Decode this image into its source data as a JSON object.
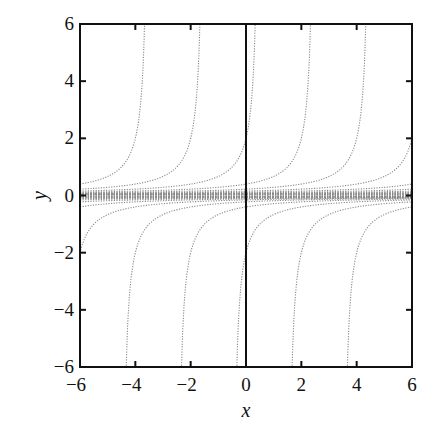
{
  "chart_data": {
    "type": "line",
    "title": "",
    "xlabel": "x",
    "ylabel": "y",
    "xlim": [
      -6,
      6
    ],
    "ylim": [
      -6,
      6
    ],
    "grid": false,
    "legend": null,
    "x_ticks": [
      -6,
      -4,
      -2,
      0,
      2,
      4,
      6
    ],
    "y_ticks": [
      -6,
      -4,
      -2,
      0,
      2,
      4,
      6
    ],
    "x_tick_labels": [
      "−6",
      "−4",
      "−2",
      "0",
      "2",
      "4",
      "6"
    ],
    "y_tick_labels": [
      "−6",
      "−4",
      "−2",
      "0",
      "2",
      "4",
      "6"
    ],
    "vertical_reference_line_x": 0,
    "curve_style": "dotted gray",
    "series": [
      {
        "name": "upper branch c=-3.5",
        "formula": "y=1/(c-x)",
        "c": -3.5,
        "branch": "x<c"
      },
      {
        "name": "upper branch c=-1.5",
        "formula": "y=1/(c-x)",
        "c": -1.5,
        "branch": "x<c"
      },
      {
        "name": "upper branch c=0.5",
        "formula": "y=1/(c-x)",
        "c": 0.5,
        "branch": "x<c"
      },
      {
        "name": "upper branch c=2.5",
        "formula": "y=1/(c-x)",
        "c": 2.5,
        "branch": "x<c"
      },
      {
        "name": "upper branch c=4.5",
        "formula": "y=1/(c-x)",
        "c": 4.5,
        "branch": "x<c"
      },
      {
        "name": "lower branch c=-4.5",
        "formula": "y=1/(c-x)",
        "c": -4.5,
        "branch": "x>c"
      },
      {
        "name": "lower branch c=-2.5",
        "formula": "y=1/(c-x)",
        "c": -2.5,
        "branch": "x>c"
      },
      {
        "name": "lower branch c=-0.5",
        "formula": "y=1/(c-x)",
        "c": -0.5,
        "branch": "x>c"
      },
      {
        "name": "lower branch c=1.5",
        "formula": "y=1/(c-x)",
        "c": 1.5,
        "branch": "x>c"
      },
      {
        "name": "lower branch c=3.5",
        "formula": "y=1/(c-x)",
        "c": 3.5,
        "branch": "x>c"
      }
    ],
    "band_curves": {
      "upper_near_zero_c": [
        6.5,
        8.5,
        10.5,
        12.5,
        14.5,
        16.5,
        18.5,
        20.5,
        24,
        30,
        40,
        60
      ],
      "lower_near_zero_c": [
        -6.5,
        -8.5,
        -10.5,
        -12.5,
        -14.5,
        -16.5,
        -18.5,
        -20.5,
        -24,
        -30,
        -40,
        -60
      ]
    }
  }
}
